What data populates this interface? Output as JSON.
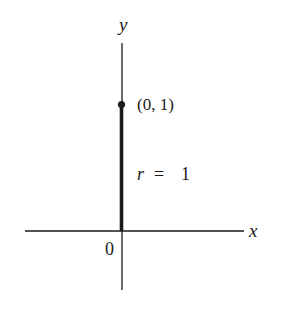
{
  "diagram": {
    "axes": {
      "x_label": "x",
      "y_label": "y",
      "origin_label": "0"
    },
    "point": {
      "label": "(0, 1)",
      "x": 0,
      "y": 1
    },
    "segment": {
      "label_var": "r",
      "label_eq": "=",
      "label_val": "1",
      "from": [
        0,
        0
      ],
      "to": [
        0,
        1
      ]
    },
    "colors": {
      "ink": "#1a1a1a",
      "background": "#ffffff"
    }
  }
}
